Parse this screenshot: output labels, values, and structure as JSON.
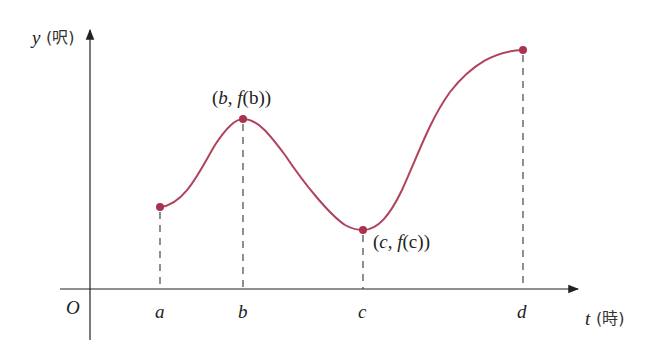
{
  "diagram": {
    "type": "function-graph",
    "axes": {
      "y_label": "y",
      "y_unit": "(呎)",
      "x_label": "t",
      "x_unit": "(時)",
      "origin_label": "O"
    },
    "ticks": [
      {
        "label": "a"
      },
      {
        "label": "b"
      },
      {
        "label": "c"
      },
      {
        "label": "d"
      }
    ],
    "point_labels": {
      "b": {
        "open": "(",
        "var": "b",
        "sep": ", ",
        "func": "f",
        "arg": "(b))"
      },
      "c": {
        "open": "(",
        "var": "c",
        "sep": ", ",
        "func": "f",
        "arg": "(c))"
      }
    },
    "colors": {
      "curve": "#b0435b",
      "point": "#a8334d",
      "axis": "#222222"
    }
  }
}
